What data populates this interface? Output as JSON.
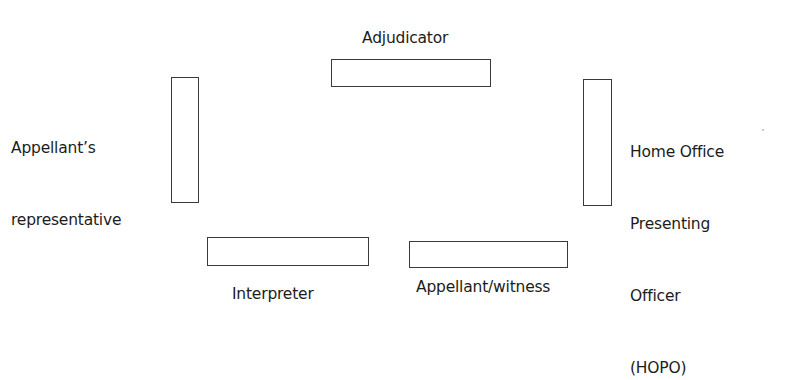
{
  "diagram": {
    "participants": [
      {
        "id": "adjudicator",
        "label": "Adjudicator",
        "seat": {
          "x": 331,
          "y": 59,
          "w": 160,
          "h": 28,
          "orientation": "horizontal"
        }
      },
      {
        "id": "appellants-representative",
        "label_lines": [
          "Appellant’s",
          "representative"
        ],
        "seat": {
          "x": 171,
          "y": 77,
          "w": 28,
          "h": 126,
          "orientation": "vertical"
        }
      },
      {
        "id": "hopo",
        "label_lines": [
          "Home Office",
          "Presenting",
          "Officer",
          "(HOPO)"
        ],
        "seat": {
          "x": 583,
          "y": 79,
          "w": 29,
          "h": 127,
          "orientation": "vertical"
        }
      },
      {
        "id": "interpreter",
        "label": "Interpreter",
        "seat": {
          "x": 207,
          "y": 237,
          "w": 162,
          "h": 29,
          "orientation": "horizontal"
        }
      },
      {
        "id": "appellant-witness",
        "label": "Appellant/witness",
        "seat": {
          "x": 409,
          "y": 241,
          "w": 159,
          "h": 27,
          "orientation": "horizontal"
        }
      }
    ],
    "colors": {
      "background": "#ffffff",
      "seat_border": "#3a3a3a",
      "text": "#1c1c1c"
    }
  }
}
